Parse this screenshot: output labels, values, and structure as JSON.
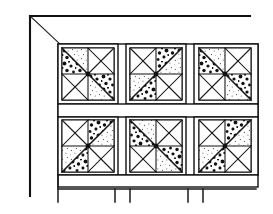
{
  "illustration": {
    "title": "Quilt rack with pinwheel quilt blocks",
    "type": "line-drawing",
    "style": "black-and-white pen illustration",
    "canvas": {
      "width": 273,
      "height": 214
    },
    "colors": {
      "ink": "#111111",
      "paper": "#ffffff",
      "fabric_dark": "#1a1a1a",
      "fabric_light": "#4a4a4a"
    }
  },
  "rack": {
    "name": "quilt-display-rack",
    "parts": [
      {
        "id": "top-rail",
        "label": "Top rail",
        "x1": 30,
        "y1": 16,
        "x2": 250,
        "y2": 16
      },
      {
        "id": "left-post",
        "label": "Left vertical post",
        "x1": 30,
        "y1": 16,
        "x2": 30,
        "y2": 195
      },
      {
        "id": "diagonal-brace",
        "label": "Diagonal brace",
        "x1": 30,
        "y1": 16,
        "x2": 61,
        "y2": 44
      },
      {
        "id": "lower-rail",
        "label": "Lower rail",
        "x1": 58,
        "y1": 188,
        "x2": 255,
        "y2": 188
      },
      {
        "id": "lower-rail-drop",
        "label": "Lower rail left drop",
        "x1": 58,
        "y1": 175,
        "x2": 58,
        "y2": 200
      }
    ],
    "legs": [
      {
        "id": "leg-1",
        "x": 58,
        "y_top": 188,
        "y_bottom": 202
      },
      {
        "id": "leg-2",
        "x": 115,
        "y_top": 188,
        "y_bottom": 202
      },
      {
        "id": "leg-3",
        "x": 130,
        "y_top": 188,
        "y_bottom": 202
      },
      {
        "id": "leg-4",
        "x": 188,
        "y_top": 188,
        "y_bottom": 202
      },
      {
        "id": "leg-5",
        "x": 203,
        "y_top": 188,
        "y_bottom": 202
      }
    ]
  },
  "quilt": {
    "name": "pinwheel-quilt",
    "pattern_name": "Pinwheel",
    "rows": 2,
    "columns": 3,
    "block_count": 6,
    "grid": {
      "x": 58,
      "y": 44,
      "width": 200,
      "height": 131
    },
    "sashing": {
      "outer_stroke": 1.6,
      "vertical_positions": [
        118,
        122,
        186,
        190
      ],
      "horizontal_band": {
        "y": 104,
        "height": 13
      },
      "bottom_band": {
        "y": 162,
        "height": 13
      }
    },
    "blocks": [
      {
        "id": "block-r1c1",
        "row": 1,
        "column": 1,
        "label": "Pinwheel block row 1 column 1",
        "x": 62,
        "y": 48,
        "size": 52,
        "rotation": 0,
        "blades": [
          {
            "position": "upper-left",
            "fabric": "dark"
          },
          {
            "position": "upper-right",
            "fabric": "light"
          },
          {
            "position": "lower-right",
            "fabric": "dark"
          },
          {
            "position": "lower-left",
            "fabric": "light"
          }
        ]
      },
      {
        "id": "block-r1c2",
        "row": 1,
        "column": 2,
        "label": "Pinwheel block row 1 column 2",
        "x": 130,
        "y": 48,
        "size": 52,
        "rotation": 90,
        "blades": [
          {
            "position": "upper-left",
            "fabric": "light"
          },
          {
            "position": "upper-right",
            "fabric": "dark"
          },
          {
            "position": "lower-right",
            "fabric": "light"
          },
          {
            "position": "lower-left",
            "fabric": "dark"
          }
        ]
      },
      {
        "id": "block-r1c3",
        "row": 1,
        "column": 3,
        "label": "Pinwheel block row 1 column 3",
        "x": 198,
        "y": 48,
        "size": 52,
        "rotation": 0,
        "blades": [
          {
            "position": "upper-left",
            "fabric": "dark"
          },
          {
            "position": "upper-right",
            "fabric": "light"
          },
          {
            "position": "lower-right",
            "fabric": "dark"
          },
          {
            "position": "lower-left",
            "fabric": "light"
          }
        ]
      },
      {
        "id": "block-r2c1",
        "row": 2,
        "column": 1,
        "label": "Pinwheel block row 2 column 1",
        "x": 62,
        "y": 119,
        "size": 52,
        "rotation": 90,
        "blades": [
          {
            "position": "upper-left",
            "fabric": "light"
          },
          {
            "position": "upper-right",
            "fabric": "dark"
          },
          {
            "position": "lower-right",
            "fabric": "light"
          },
          {
            "position": "lower-left",
            "fabric": "dark"
          }
        ]
      },
      {
        "id": "block-r2c2",
        "row": 2,
        "column": 2,
        "label": "Pinwheel block row 2 column 2",
        "x": 130,
        "y": 119,
        "size": 52,
        "rotation": 180,
        "blades": [
          {
            "position": "upper-left",
            "fabric": "dark"
          },
          {
            "position": "upper-right",
            "fabric": "light"
          },
          {
            "position": "lower-right",
            "fabric": "dark"
          },
          {
            "position": "lower-left",
            "fabric": "light"
          }
        ]
      },
      {
        "id": "block-r2c3",
        "row": 2,
        "column": 3,
        "label": "Pinwheel block row 2 column 3",
        "x": 198,
        "y": 119,
        "size": 52,
        "rotation": 90,
        "blades": [
          {
            "position": "upper-left",
            "fabric": "light"
          },
          {
            "position": "upper-right",
            "fabric": "dark"
          },
          {
            "position": "lower-right",
            "fabric": "light"
          },
          {
            "position": "lower-left",
            "fabric": "dark"
          }
        ]
      }
    ]
  }
}
